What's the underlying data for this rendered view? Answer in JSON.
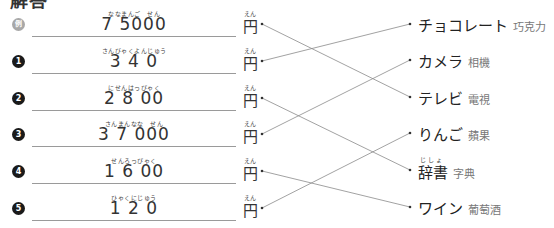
{
  "heading": "解答",
  "left_items": [
    {
      "badge": "例",
      "type": "example",
      "ruby": "ななまんご　せん",
      "amount": "7 5000",
      "yen_ruby": "えん",
      "yen": "円"
    },
    {
      "badge": "1",
      "type": "number",
      "ruby": "さんびゃくよんじゅう",
      "amount": "3 4 0",
      "yen_ruby": "えん",
      "yen": "円"
    },
    {
      "badge": "2",
      "type": "number",
      "ruby": "にせんはっぴゃく",
      "amount": "2 8 00",
      "yen_ruby": "えん",
      "yen": "円"
    },
    {
      "badge": "3",
      "type": "number",
      "ruby": "さんまんなな　せん",
      "amount": "3 7 000",
      "yen_ruby": "えん",
      "yen": "円"
    },
    {
      "badge": "4",
      "type": "number",
      "ruby": "せんろっぴゃく",
      "amount": "1 6 00",
      "yen_ruby": "えん",
      "yen": "円"
    },
    {
      "badge": "5",
      "type": "number",
      "ruby": "ひゃくにじゅう",
      "amount": "1 2 0",
      "yen_ruby": "えん",
      "yen": "円"
    }
  ],
  "right_items": [
    {
      "jp": "チョコレート",
      "zh": "巧克力",
      "ruby": ""
    },
    {
      "jp": "カメラ",
      "zh": "相機",
      "ruby": ""
    },
    {
      "jp": "テレビ",
      "zh": "電視",
      "ruby": ""
    },
    {
      "jp": "りんご",
      "zh": "蘋果",
      "ruby": ""
    },
    {
      "jp": "辞書",
      "zh": "字典",
      "ruby": "じしょ"
    },
    {
      "jp": "ワイン",
      "zh": "葡萄酒",
      "ruby": ""
    }
  ],
  "connections": [
    {
      "from": 0,
      "to": 2
    },
    {
      "from": 1,
      "to": 0
    },
    {
      "from": 2,
      "to": 4
    },
    {
      "from": 3,
      "to": 1
    },
    {
      "from": 4,
      "to": 5
    },
    {
      "from": 5,
      "to": 3
    }
  ],
  "colors": {
    "line": "#8a8a8a",
    "badge": "#1a1a1a",
    "badge_example": "#a8a8a8"
  }
}
